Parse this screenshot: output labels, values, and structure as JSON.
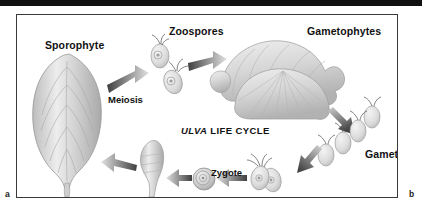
{
  "figure": {
    "title_italic_part": "ULVA",
    "title_roman_part": "LIFE CYCLE",
    "part_labels": {
      "left": "a",
      "right": "b"
    },
    "frame_color": "#3a3a3a",
    "background_color": "#ffffff",
    "ink_color": "#111111",
    "organism_fill": "#d8d8d8",
    "arrow_dark": "#4a4a4a",
    "arrow_light": "#d9d9d9"
  },
  "labels": {
    "sporophyte": "Sporophyte",
    "zoospores": "Zoospores",
    "gametophytes": "Gametophytes",
    "meiosis": "Meiosis",
    "gametes": "Gametes",
    "fertilization": "Fertilization",
    "zygote": "Zygote"
  },
  "cycle_stages": [
    {
      "name": "Sporophyte",
      "kind": "blade",
      "note": "diploid leaf-like blade with radiating ribs"
    },
    {
      "name": "Meiosis",
      "kind": "process-arrow",
      "note": "arrow from sporophyte to zoospores"
    },
    {
      "name": "Zoospores",
      "kind": "flagellated-cells",
      "count": 2
    },
    {
      "name": "Gametophytes",
      "kind": "ruffled-thallus"
    },
    {
      "name": "Gametes",
      "kind": "flagellated-cells",
      "count": 4
    },
    {
      "name": "Fertilization",
      "kind": "process-arrow",
      "note": "two gametes fusing"
    },
    {
      "name": "Zygote",
      "kind": "round-cell",
      "note": "concentric round cell"
    }
  ],
  "icon_names": [
    "sporophyte-blade-icon",
    "zoospore-cell-icon",
    "gametophyte-thallus-icon",
    "gamete-cell-icon",
    "zygote-cell-icon",
    "germling-icon",
    "cycle-arrow-icon"
  ]
}
